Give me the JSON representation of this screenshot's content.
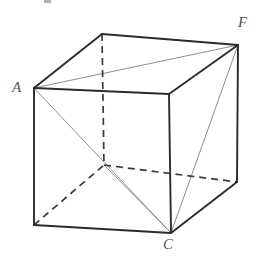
{
  "figure": {
    "width": 256,
    "height": 261,
    "background": "#ffffff",
    "labels": [
      {
        "id": "A",
        "text": "A",
        "x": 12,
        "y": 80,
        "vertex": "front-top-left"
      },
      {
        "id": "F",
        "text": "F",
        "x": 238,
        "y": 15,
        "vertex": "back-top-right"
      },
      {
        "id": "C",
        "text": "C",
        "x": 163,
        "y": 237,
        "vertex": "front-bottom-right"
      }
    ],
    "colors": {
      "visible_edge": "#2b2b2b",
      "hidden_edge": "#3a3a3a",
      "diagonal": "#8e8e8e",
      "label": "#555555"
    },
    "vertices": {
      "front_top_left": [
        34,
        88
      ],
      "front_top_right": [
        169,
        94
      ],
      "front_bottom_left": [
        34,
        225
      ],
      "front_bottom_right": [
        171,
        233
      ],
      "back_top_left": [
        102,
        34
      ],
      "back_top_right": [
        238,
        45
      ],
      "back_bottom_left": [
        104,
        165
      ],
      "back_bottom_right": [
        237,
        182
      ]
    },
    "edges_visible": [
      {
        "name": "front-top",
        "from": "front_top_left",
        "to": "front_top_right"
      },
      {
        "name": "front-left",
        "from": "front_top_left",
        "to": "front_bottom_left"
      },
      {
        "name": "front-right",
        "from": "front_top_right",
        "to": "front_bottom_right"
      },
      {
        "name": "front-bottom",
        "from": "front_bottom_left",
        "to": "front_bottom_right"
      },
      {
        "name": "top-left-back",
        "from": "front_top_left",
        "to": "back_top_left"
      },
      {
        "name": "top-back",
        "from": "back_top_left",
        "to": "back_top_right"
      },
      {
        "name": "top-right-back",
        "from": "front_top_right",
        "to": "back_top_right"
      },
      {
        "name": "right-back-vertical",
        "from": "back_top_right",
        "to": "back_bottom_right"
      },
      {
        "name": "bottom-right-back",
        "from": "front_bottom_right",
        "to": "back_bottom_right"
      }
    ],
    "edges_hidden": [
      {
        "name": "back-left-vertical",
        "from": "back_top_left",
        "to": "back_bottom_left"
      },
      {
        "name": "bottom-back",
        "from": "back_bottom_left",
        "to": "back_bottom_right"
      },
      {
        "name": "bottom-left-back",
        "from": "front_bottom_left",
        "to": "back_bottom_left"
      }
    ],
    "diagonals": [
      {
        "name": "A-to-F-top-face",
        "from": "front_top_left",
        "to": "back_top_right"
      },
      {
        "name": "A-to-C-front-face",
        "from": "front_top_left",
        "to": "front_bottom_right"
      },
      {
        "name": "F-to-C-right-face",
        "from": "back_top_right",
        "to": "front_bottom_right"
      },
      {
        "name": "C-to-back-bottom-left",
        "from": "front_bottom_right",
        "to": "back_bottom_left"
      }
    ]
  }
}
